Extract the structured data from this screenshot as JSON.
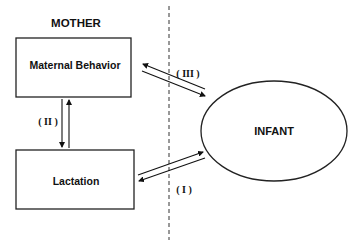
{
  "diagram": {
    "group_label": "MOTHER",
    "nodes": {
      "maternal_behavior": "Maternal Behavior",
      "lactation": "Lactation",
      "infant": "INFANT"
    },
    "edges": {
      "I": {
        "label": "( I )",
        "between": [
          "Lactation",
          "INFANT"
        ],
        "bidirectional": true
      },
      "II": {
        "label": "( II )",
        "between": [
          "Maternal Behavior",
          "Lactation"
        ],
        "bidirectional": true
      },
      "III": {
        "label": "( III )",
        "between": [
          "Maternal Behavior",
          "INFANT"
        ],
        "bidirectional": true
      }
    },
    "divider": "dashed vertical line separating mother and infant"
  }
}
